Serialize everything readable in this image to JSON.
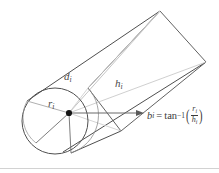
{
  "figure": {
    "kind": "geometry-diagram",
    "background_color": "#ffffff",
    "labels": {
      "slant": {
        "base": "d",
        "subscript": "i"
      },
      "axis": {
        "base": "h",
        "subscript": "i"
      },
      "radius": {
        "base": "r",
        "subscript": "i"
      }
    },
    "equation": {
      "lhs_var": "b",
      "lhs_sub": "i",
      "equals": "=",
      "function": "tan",
      "exponent": "−1",
      "open_paren": "(",
      "close_paren": ")",
      "numerator": "r",
      "numerator_sub": "i",
      "denominator": "h",
      "denominator_sub": "i"
    },
    "colors": {
      "outline": "#4f4f4f",
      "outline_dark": "#3a3a3a",
      "inner_line": "#b9b9b9",
      "inner_line_light": "#cccccc",
      "arrow": "#6a6a6a",
      "apex_dot": "#111111",
      "bottom_rule": "#d2d2d2",
      "text": "#3a3a3a"
    },
    "geometry": {
      "apex": {
        "x": 69,
        "y": 113
      },
      "circle": {
        "cx": 55,
        "cy": 121,
        "r": 33
      },
      "arrow": {
        "x1": 69,
        "y1": 113,
        "x2": 143,
        "y2": 113
      },
      "far_end": [
        {
          "x": 160,
          "y": 11
        },
        {
          "x": 206,
          "y": 62
        },
        {
          "x": 121,
          "y": 131
        },
        {
          "x": 88,
          "y": 88
        }
      ]
    }
  }
}
